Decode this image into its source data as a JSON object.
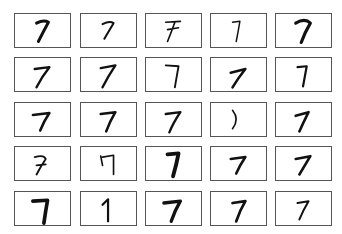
{
  "grid": {
    "rows": 5,
    "cols": 5,
    "digit_label": "7",
    "stroke_color": "#111111",
    "border_color": "#555555",
    "cells": [
      {
        "d": "M22 10 Q30 6 35 9 Q30 18 24 30",
        "w": 3.2
      },
      {
        "d": "M22 11 Q30 7 34 10 Q28 20 24 27",
        "w": 2.2
      },
      {
        "d": "M20 9 L36 8 M22 17 L34 15 M30 9 Q26 20 22 30",
        "w": 1.8
      },
      {
        "d": "M22 9 L30 8 Q28 20 26 30",
        "w": 1.6
      },
      {
        "d": "M20 10 Q30 4 36 10 Q30 20 26 31",
        "w": 3.4
      },
      {
        "d": "M20 12 L36 10 Q28 20 22 32",
        "w": 2.6
      },
      {
        "d": "M20 11 L36 8 Q28 20 22 32",
        "w": 2.6
      },
      {
        "d": "M20 8 L34 9 Q32 20 30 32",
        "w": 2.0
      },
      {
        "d": "M20 16 L36 12 Q28 22 22 32",
        "w": 2.8
      },
      {
        "d": "M22 10 L32 9 Q30 20 28 31",
        "w": 2.4
      },
      {
        "d": "M18 13 L36 11 Q30 20 26 30",
        "w": 2.8
      },
      {
        "d": "M20 12 L36 10 Q30 20 26 31",
        "w": 2.8
      },
      {
        "d": "M20 12 L36 10 Q28 22 24 32",
        "w": 2.6
      },
      {
        "d": "M22 8 Q30 18 22 28",
        "w": 1.8
      },
      {
        "d": "M20 14 L34 10 Q28 22 24 31",
        "w": 2.8
      },
      {
        "d": "M20 11 Q30 8 32 13 Q26 22 22 30 M22 20 L32 19",
        "w": 2.0
      },
      {
        "d": "M20 10 L22 20 M22 11 L34 9 Q34 20 34 30",
        "w": 1.8
      },
      {
        "d": "M22 8 L34 7 Q32 18 28 32",
        "w": 4.2
      },
      {
        "d": "M20 13 L36 11 Q30 20 26 29",
        "w": 2.8
      },
      {
        "d": "M20 13 L36 10 Q30 20 24 30",
        "w": 2.8
      },
      {
        "d": "M18 10 L34 9 Q32 20 30 34",
        "w": 4.0
      },
      {
        "d": "M22 14 L28 8 Q28 20 28 32",
        "w": 2.4
      },
      {
        "d": "M18 12 L36 10 Q30 20 26 32",
        "w": 3.6
      },
      {
        "d": "M22 12 L36 10 Q30 20 26 32",
        "w": 3.0
      },
      {
        "d": "M22 12 L34 10 Q28 20 24 30",
        "w": 2.2
      }
    ]
  }
}
